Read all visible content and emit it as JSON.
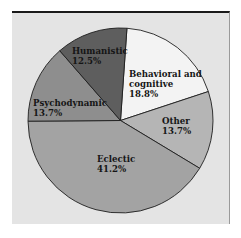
{
  "chart_data": {
    "type": "pie",
    "title": "",
    "start_angle_deg": 4,
    "direction": "clockwise",
    "slices": [
      {
        "label": "Behavioral and cognitive",
        "label_lines": [
          "Behavioral and",
          "cognitive"
        ],
        "value": 18.8,
        "value_text": "18.8%",
        "color": "#f3f3f3"
      },
      {
        "label": "Other",
        "label_lines": [
          "Other"
        ],
        "value": 13.7,
        "value_text": "13.7%",
        "color": "#b5b5b5"
      },
      {
        "label": "Eclectic",
        "label_lines": [
          "Eclectic"
        ],
        "value": 41.2,
        "value_text": "41.2%",
        "color": "#a3a3a3"
      },
      {
        "label": "Psychodynamic",
        "label_lines": [
          "Psychodynamic"
        ],
        "value": 13.7,
        "value_text": "13.7%",
        "color": "#8e8e8e"
      },
      {
        "label": "Humanistic",
        "label_lines": [
          "Humanistic"
        ],
        "value": 12.5,
        "value_text": "12.5%",
        "color": "#5e5e5e"
      }
    ],
    "legend": "none (labels placed inside slices)"
  }
}
